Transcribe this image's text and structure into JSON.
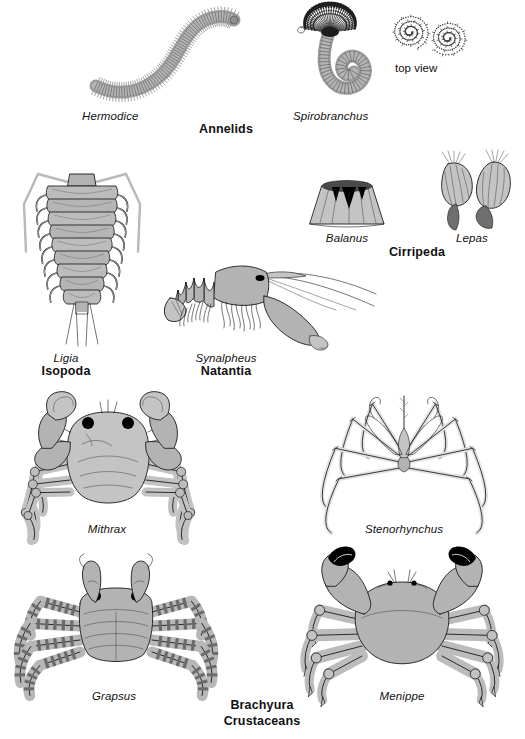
{
  "plate": {
    "title": "Marine Invertebrates — Annelids and Crustaceans",
    "background_color": "#ffffff",
    "ink_color": "#1a1a1a",
    "body_fill_color": "#b3b3b3",
    "body_fill_light": "#c4c4c4",
    "body_fill_dark": "#8e8e8e"
  },
  "rows": [
    {
      "group_label": "Annelids",
      "specimens": [
        {
          "genus": "Hermodice",
          "common": "fireworm",
          "note": ""
        },
        {
          "genus": "Spirobranchus",
          "common": "christmas tree worm",
          "note": "top view"
        }
      ]
    },
    {
      "group_labels": [
        "Isopoda",
        "Natantia",
        "Cirripeda"
      ],
      "specimens": [
        {
          "genus": "Ligia",
          "group": "Isopoda"
        },
        {
          "genus": "Synalpheus",
          "group": "Natantia"
        },
        {
          "genus": "Balanus",
          "group": "Cirripeda"
        },
        {
          "genus": "Lepas",
          "group": "Cirripeda"
        }
      ]
    },
    {
      "group_label": "",
      "specimens": [
        {
          "genus": "Mithrax",
          "group": "Brachyura"
        },
        {
          "genus": "Stenorhynchus",
          "group": "Brachyura"
        }
      ]
    },
    {
      "group_label": "Brachyura",
      "group_label2": "Crustaceans",
      "specimens": [
        {
          "genus": "Grapsus",
          "group": "Brachyura"
        },
        {
          "genus": "Menippe",
          "group": "Brachyura"
        }
      ]
    }
  ],
  "labels": {
    "hermodice": "Hermodice",
    "annelids": "Annelids",
    "spirobranchus": "Spirobranchus",
    "top_view": "top view",
    "ligia": "Ligia",
    "isopoda": "Isopoda",
    "synalpheus": "Synalpheus",
    "natantia": "Natantia",
    "balanus": "Balanus",
    "cirripeda": "Cirripeda",
    "lepas": "Lepas",
    "mithrax": "Mithrax",
    "stenorhynchus": "Stenorhynchus",
    "grapsus": "Grapsus",
    "menippe": "Menippe",
    "brachyura": "Brachyura",
    "crustaceans": "Crustaceans"
  }
}
